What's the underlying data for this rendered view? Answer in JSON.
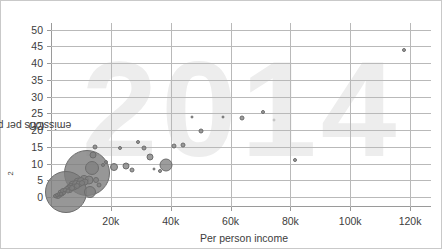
{
  "chart": {
    "type": "scatter",
    "watermark": "2014",
    "xlabel": "Per person income",
    "ylabel_main": "CO",
    "ylabel_sub": "2",
    "ylabel_rest": " emissions per person",
    "colors": {
      "bubble_fill": "#808080",
      "bubble_stroke": "#6d6d6d",
      "gridline": "#b9b9b9",
      "axis": "#9a9a9a",
      "watermark": "#ededed",
      "text": "#3d3d3d",
      "frame": "#c9c9c9"
    }
  },
  "chart_data": {
    "type": "scatter",
    "title": "",
    "subtitle": "",
    "xlabel": "Per person income",
    "ylabel": "CO2 emissions per person",
    "xlim": [
      0,
      127000
    ],
    "ylim": [
      -3,
      52
    ],
    "xticks": [
      20000,
      40000,
      60000,
      80000,
      100000,
      120000
    ],
    "xticklabels": [
      "20k",
      "40k",
      "60k",
      "80k",
      "100k",
      "120k"
    ],
    "yticks": [
      0,
      5,
      10,
      15,
      20,
      25,
      30,
      35,
      40,
      45,
      50
    ],
    "yticklabels": [
      "0",
      "5",
      "10",
      "15",
      "20",
      "25",
      "30",
      "35",
      "40",
      "45",
      "50"
    ],
    "grid": true,
    "legend": false,
    "size_encodes": "population",
    "annotation": "2014",
    "points": [
      {
        "x": 1500,
        "y": 0.3,
        "size": 4
      },
      {
        "x": 1800,
        "y": 0.2,
        "size": 5
      },
      {
        "x": 2100,
        "y": 0.5,
        "size": 4
      },
      {
        "x": 2400,
        "y": 0.4,
        "size": 6
      },
      {
        "x": 2700,
        "y": 0.8,
        "size": 4
      },
      {
        "x": 3000,
        "y": 0.6,
        "size": 5
      },
      {
        "x": 3200,
        "y": 1.0,
        "size": 4
      },
      {
        "x": 3500,
        "y": 1.3,
        "size": 7
      },
      {
        "x": 3800,
        "y": 0.9,
        "size": 5
      },
      {
        "x": 4100,
        "y": 1.7,
        "size": 6
      },
      {
        "x": 4400,
        "y": 1.2,
        "size": 4
      },
      {
        "x": 4700,
        "y": 2.0,
        "size": 5
      },
      {
        "x": 5000,
        "y": 1.6,
        "size": 42
      },
      {
        "x": 5300,
        "y": 2.4,
        "size": 6
      },
      {
        "x": 5600,
        "y": 1.9,
        "size": 5
      },
      {
        "x": 5900,
        "y": 2.8,
        "size": 7
      },
      {
        "x": 6200,
        "y": 2.2,
        "size": 6
      },
      {
        "x": 6600,
        "y": 3.1,
        "size": 8
      },
      {
        "x": 7000,
        "y": 2.6,
        "size": 6
      },
      {
        "x": 7400,
        "y": 3.6,
        "size": 9
      },
      {
        "x": 7800,
        "y": 3.0,
        "size": 7
      },
      {
        "x": 8200,
        "y": 4.0,
        "size": 8
      },
      {
        "x": 8600,
        "y": 3.4,
        "size": 6
      },
      {
        "x": 9000,
        "y": 4.4,
        "size": 9
      },
      {
        "x": 9500,
        "y": 3.8,
        "size": 7
      },
      {
        "x": 10000,
        "y": 4.7,
        "size": 8
      },
      {
        "x": 10500,
        "y": 4.2,
        "size": 6
      },
      {
        "x": 11000,
        "y": 5.0,
        "size": 10
      },
      {
        "x": 11500,
        "y": 4.5,
        "size": 7
      },
      {
        "x": 12000,
        "y": 7.2,
        "size": 46
      },
      {
        "x": 12600,
        "y": 5.2,
        "size": 9
      },
      {
        "x": 13200,
        "y": 1.5,
        "size": 12
      },
      {
        "x": 13800,
        "y": 8.6,
        "size": 14
      },
      {
        "x": 14200,
        "y": 12.5,
        "size": 7
      },
      {
        "x": 14600,
        "y": 15.0,
        "size": 5
      },
      {
        "x": 15200,
        "y": 5.0,
        "size": 6
      },
      {
        "x": 16000,
        "y": 3.5,
        "size": 5
      },
      {
        "x": 17500,
        "y": 9.5,
        "size": 4
      },
      {
        "x": 18500,
        "y": 10.5,
        "size": 4
      },
      {
        "x": 21000,
        "y": 9.0,
        "size": 8
      },
      {
        "x": 23000,
        "y": 14.5,
        "size": 4
      },
      {
        "x": 25000,
        "y": 9.2,
        "size": 7
      },
      {
        "x": 27000,
        "y": 8.2,
        "size": 5
      },
      {
        "x": 29000,
        "y": 16.5,
        "size": 4
      },
      {
        "x": 31000,
        "y": 14.5,
        "size": 5
      },
      {
        "x": 33000,
        "y": 11.8,
        "size": 7
      },
      {
        "x": 34500,
        "y": 8.4,
        "size": 3
      },
      {
        "x": 36500,
        "y": 7.8,
        "size": 4
      },
      {
        "x": 38500,
        "y": 9.6,
        "size": 13
      },
      {
        "x": 41000,
        "y": 15.3,
        "size": 5
      },
      {
        "x": 44000,
        "y": 15.4,
        "size": 5
      },
      {
        "x": 47000,
        "y": 24.0,
        "size": 3
      },
      {
        "x": 50000,
        "y": 19.7,
        "size": 5
      },
      {
        "x": 57500,
        "y": 24.0,
        "size": 3
      },
      {
        "x": 64000,
        "y": 23.6,
        "size": 5
      },
      {
        "x": 71000,
        "y": 25.4,
        "size": 4
      },
      {
        "x": 74500,
        "y": 23.0,
        "y_faint": true,
        "size": 3
      },
      {
        "x": 81500,
        "y": 11.0,
        "size": 4
      },
      {
        "x": 118000,
        "y": 44.0,
        "size": 4
      }
    ]
  },
  "axis": {
    "yticks": [
      "50",
      "45",
      "40",
      "35",
      "30",
      "25",
      "20",
      "15",
      "10",
      "5",
      "0"
    ],
    "xticks": [
      "20k",
      "40k",
      "60k",
      "80k",
      "100k",
      "120k"
    ]
  }
}
